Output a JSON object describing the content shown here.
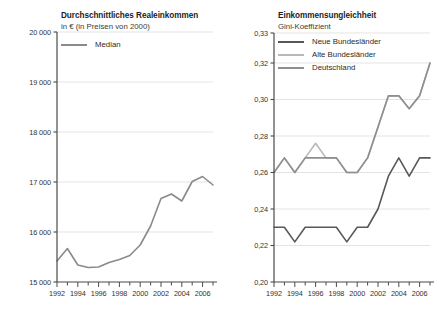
{
  "page": {
    "background": "#ffffff",
    "width": 439,
    "height": 311
  },
  "colors": {
    "axis": "#4a4a4a",
    "grid": "#d8d8d8",
    "median": "#8a8a8a",
    "neue_bundeslaender": "#585858",
    "alte_bundeslaender": "#b9b9b9",
    "deutschland": "#8f8f8f",
    "text": "#2b2b2b"
  },
  "left": {
    "title": "Durchschnittliches Realeinkommen",
    "subtitle": "in € (in Preisen von 2000)",
    "legend": [
      {
        "label": "Median",
        "color": "#8a8a8a",
        "name": "median"
      }
    ],
    "y_ticks": [
      "20 000",
      "19 000",
      "18 000",
      "17 000",
      "16 000",
      "15 000"
    ],
    "x_ticks": [
      "1992",
      "1994",
      "1996",
      "1998",
      "2000",
      "2002",
      "2004",
      "2006"
    ]
  },
  "right": {
    "title": "Einkommensungleichheit",
    "subtitle": "Gini-Koeffizient",
    "legend": [
      {
        "label": "Neue Bundesländer",
        "color": "#585858",
        "name": "neue-bundeslaender"
      },
      {
        "label": "Alte Bundesländer",
        "color": "#b9b9b9",
        "name": "alte-bundeslaender"
      },
      {
        "label": "Deutschland",
        "color": "#8f8f8f",
        "name": "deutschland"
      }
    ],
    "y_ticks": [
      "0,33",
      "0,32",
      "0,30",
      "0,28",
      "0,26",
      "0,24",
      "0,22",
      "0,20"
    ],
    "x_ticks": [
      "1992",
      "1994",
      "1996",
      "1998",
      "2000",
      "2002",
      "2004",
      "2006"
    ]
  },
  "chart_data": [
    {
      "type": "line",
      "title": "Durchschnittliches Realeinkommen",
      "subtitle": "in € (in Preisen von 2000)",
      "xlabel": "",
      "ylabel": "in € (in Preisen von 2000)",
      "ylim": [
        15000,
        20000
      ],
      "xlim": [
        1992,
        2007
      ],
      "grid": true,
      "legend_position": "top-left",
      "x": [
        1992,
        1993,
        1994,
        1995,
        1996,
        1997,
        1998,
        1999,
        2000,
        2001,
        2002,
        2003,
        2004,
        2005,
        2006,
        2007
      ],
      "series": [
        {
          "name": "Median",
          "color": "#8a8a8a",
          "values": [
            15420,
            15670,
            15340,
            15290,
            15300,
            15390,
            15450,
            15530,
            15740,
            16120,
            16670,
            16760,
            16620,
            17010,
            17110,
            16940
          ]
        }
      ],
      "ytick_values": [
        20000,
        19000,
        18000,
        17000,
        16000,
        15000
      ],
      "ytick_labels": [
        "20 000",
        "19 000",
        "18 000",
        "17 000",
        "16 000",
        "15 000"
      ],
      "xtick_values": [
        1992,
        1994,
        1996,
        1998,
        2000,
        2002,
        2004,
        2006
      ],
      "xtick_labels": [
        "1992",
        "1994",
        "1996",
        "1998",
        "2000",
        "2002",
        "2004",
        "2006"
      ]
    },
    {
      "type": "line",
      "title": "Einkommensungleichheit",
      "subtitle": "Gini-Koeffizient",
      "xlabel": "",
      "ylabel": "Gini-Koeffizient",
      "ylim": [
        0.2,
        0.33
      ],
      "xlim": [
        1992,
        2007
      ],
      "grid": true,
      "legend_position": "top-left",
      "note": "y-axis compressed between 0,32 and 0,33",
      "x": [
        1992,
        1993,
        1994,
        1995,
        1996,
        1997,
        1998,
        1999,
        2000,
        2001,
        2002,
        2003,
        2004,
        2005,
        2006,
        2007
      ],
      "series": [
        {
          "name": "Neue Bundesländer",
          "color": "#585858",
          "values": [
            0.23,
            0.23,
            0.222,
            0.23,
            0.23,
            0.23,
            0.23,
            0.222,
            0.23,
            0.23,
            0.24,
            0.258,
            0.268,
            0.258,
            0.268,
            0.268
          ]
        },
        {
          "name": "Alte Bundesländer",
          "color": "#b9b9b9",
          "values": [
            0.26,
            0.268,
            0.26,
            0.268,
            0.276,
            0.268,
            0.268,
            0.26,
            0.26,
            0.268,
            0.285,
            0.302,
            0.302,
            0.295,
            0.302,
            0.32
          ]
        },
        {
          "name": "Deutschland",
          "color": "#8f8f8f",
          "values": [
            0.26,
            0.268,
            0.26,
            0.268,
            0.268,
            0.268,
            0.268,
            0.26,
            0.26,
            0.268,
            0.285,
            0.302,
            0.302,
            0.295,
            0.302,
            0.32
          ]
        }
      ],
      "ytick_values": [
        0.33,
        0.32,
        0.3,
        0.28,
        0.26,
        0.24,
        0.22,
        0.2
      ],
      "ytick_labels": [
        "0,33",
        "0,32",
        "0,30",
        "0,28",
        "0,26",
        "0,24",
        "0,22",
        "0,20"
      ],
      "xtick_values": [
        1992,
        1994,
        1996,
        1998,
        2000,
        2002,
        2004,
        2006
      ],
      "xtick_labels": [
        "1992",
        "1994",
        "1996",
        "1998",
        "2000",
        "2002",
        "2004",
        "2006"
      ]
    }
  ]
}
